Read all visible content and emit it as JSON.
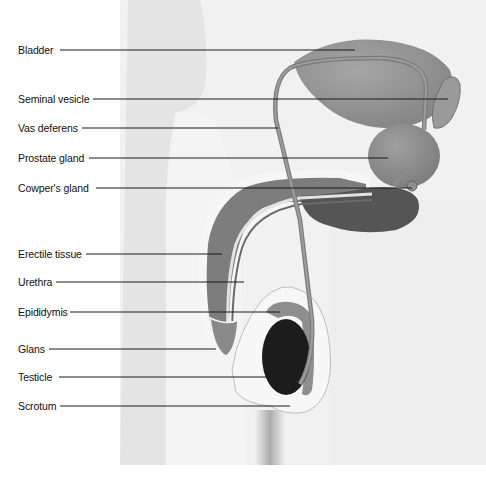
{
  "diagram": {
    "colors": {
      "background": "#ffffff",
      "body_silhouette": "#ebebeb",
      "body_highlight": "#f7f7f7",
      "organ_mid": "#8c8c8c",
      "organ_dark": "#5e5e5e",
      "testicle": "#1c1c1c",
      "leader_line": "#1a1a1a",
      "label_text": "#111111"
    },
    "labels": [
      {
        "id": "bladder",
        "text": "Bladder",
        "y": 50
      },
      {
        "id": "seminal-vesicle",
        "text": "Seminal vesicle",
        "y": 99
      },
      {
        "id": "vas-deferens",
        "text": "Vas deferens",
        "y": 128
      },
      {
        "id": "prostate-gland",
        "text": "Prostate gland",
        "y": 158
      },
      {
        "id": "cowpers-gland",
        "text": "Cowper's gland",
        "y": 188
      },
      {
        "id": "erectile-tissue",
        "text": "Erectile tissue",
        "y": 254
      },
      {
        "id": "urethra",
        "text": "Urethra",
        "y": 282
      },
      {
        "id": "epididymis",
        "text": "Epididymis",
        "y": 312
      },
      {
        "id": "glans",
        "text": "Glans",
        "y": 349
      },
      {
        "id": "testicle",
        "text": "Testicle",
        "y": 377
      },
      {
        "id": "scrotum",
        "text": "Scrotum",
        "y": 406
      }
    ]
  }
}
